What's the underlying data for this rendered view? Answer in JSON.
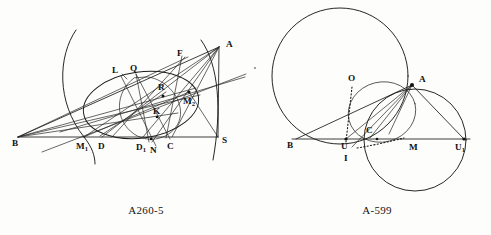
{
  "page": {
    "background_color": "#fdfdfb",
    "ink_color": "#1b1b1b",
    "width": 491,
    "height": 235
  },
  "figures": [
    {
      "id": "figure-left",
      "caption": "A260-5",
      "caption_position": {
        "x": 146,
        "y": 214
      },
      "description": "Triangle with inscribed circle, excircles, arcs and cevians",
      "points": [
        {
          "label": "B",
          "sub": "",
          "x": 18,
          "y": 137,
          "label_x": 12,
          "label_y": 146,
          "dot": false
        },
        {
          "label": "M",
          "sub": "1",
          "x": 84,
          "y": 137,
          "label_x": 76,
          "label_y": 149,
          "dot": false
        },
        {
          "label": "D",
          "sub": "",
          "x": 102,
          "y": 137,
          "label_x": 98,
          "label_y": 149,
          "dot": false
        },
        {
          "label": "D",
          "sub": "1",
          "x": 143,
          "y": 137,
          "label_x": 136,
          "label_y": 150,
          "dot": false
        },
        {
          "label": "N",
          "sub": "",
          "x": 154,
          "y": 140,
          "label_x": 150,
          "label_y": 152,
          "dot": false
        },
        {
          "label": "C",
          "sub": "",
          "x": 172,
          "y": 137,
          "label_x": 167,
          "label_y": 149,
          "dot": false
        },
        {
          "label": "S",
          "sub": "",
          "x": 218,
          "y": 137,
          "label_x": 223,
          "label_y": 143,
          "dot": false
        },
        {
          "label": "A",
          "sub": "",
          "x": 219,
          "y": 47,
          "label_x": 226,
          "label_y": 46,
          "dot": false
        },
        {
          "label": "F",
          "sub": "",
          "x": 184,
          "y": 58,
          "label_x": 178,
          "label_y": 55,
          "dot": false
        },
        {
          "label": "Q",
          "sub": "",
          "x": 136,
          "y": 74,
          "label_x": 131,
          "label_y": 70,
          "dot": false
        },
        {
          "label": "L",
          "sub": "",
          "x": 124,
          "y": 80,
          "label_x": 113,
          "label_y": 72,
          "dot": false
        },
        {
          "label": "R",
          "sub": "",
          "x": 163,
          "y": 93,
          "label_x": 159,
          "label_y": 89,
          "dot": true
        },
        {
          "label": "M",
          "sub": "2",
          "x": 189,
          "y": 92,
          "label_x": 185,
          "label_y": 104,
          "dot": true
        },
        {
          "label": "K",
          "sub": "",
          "x": 157,
          "y": 115,
          "label_x": 155,
          "label_y": 113,
          "dot": true
        }
      ]
    },
    {
      "id": "figure-right",
      "caption": "A-599",
      "caption_position": {
        "x": 377,
        "y": 214
      },
      "description": "Two intersecting circles with triangle, incenter and midpoint chords",
      "points": [
        {
          "label": "B",
          "sub": "",
          "x": 296,
          "y": 139,
          "label_x": 288,
          "label_y": 148,
          "dot": false
        },
        {
          "label": "U",
          "sub": "",
          "x": 346,
          "y": 139,
          "label_x": 341,
          "label_y": 149,
          "dot": true
        },
        {
          "label": "I",
          "sub": "",
          "x": 348,
          "y": 148,
          "label_x": 344,
          "label_y": 160,
          "dot": false
        },
        {
          "label": "C",
          "sub": "",
          "x": 371,
          "y": 135,
          "label_x": 367,
          "label_y": 133,
          "dot": false
        },
        {
          "label": "M",
          "sub": "",
          "x": 414,
          "y": 139,
          "label_x": 409,
          "label_y": 150,
          "dot": false
        },
        {
          "label": "U",
          "sub": "1",
          "x": 464,
          "y": 139,
          "label_x": 457,
          "label_y": 150,
          "dot": true
        },
        {
          "label": "A",
          "sub": "",
          "x": 412,
          "y": 85,
          "label_x": 419,
          "label_y": 81,
          "dot": true
        },
        {
          "label": "O",
          "sub": "",
          "x": 351,
          "y": 82,
          "label_x": 347,
          "label_y": 80,
          "dot": false
        }
      ]
    }
  ]
}
